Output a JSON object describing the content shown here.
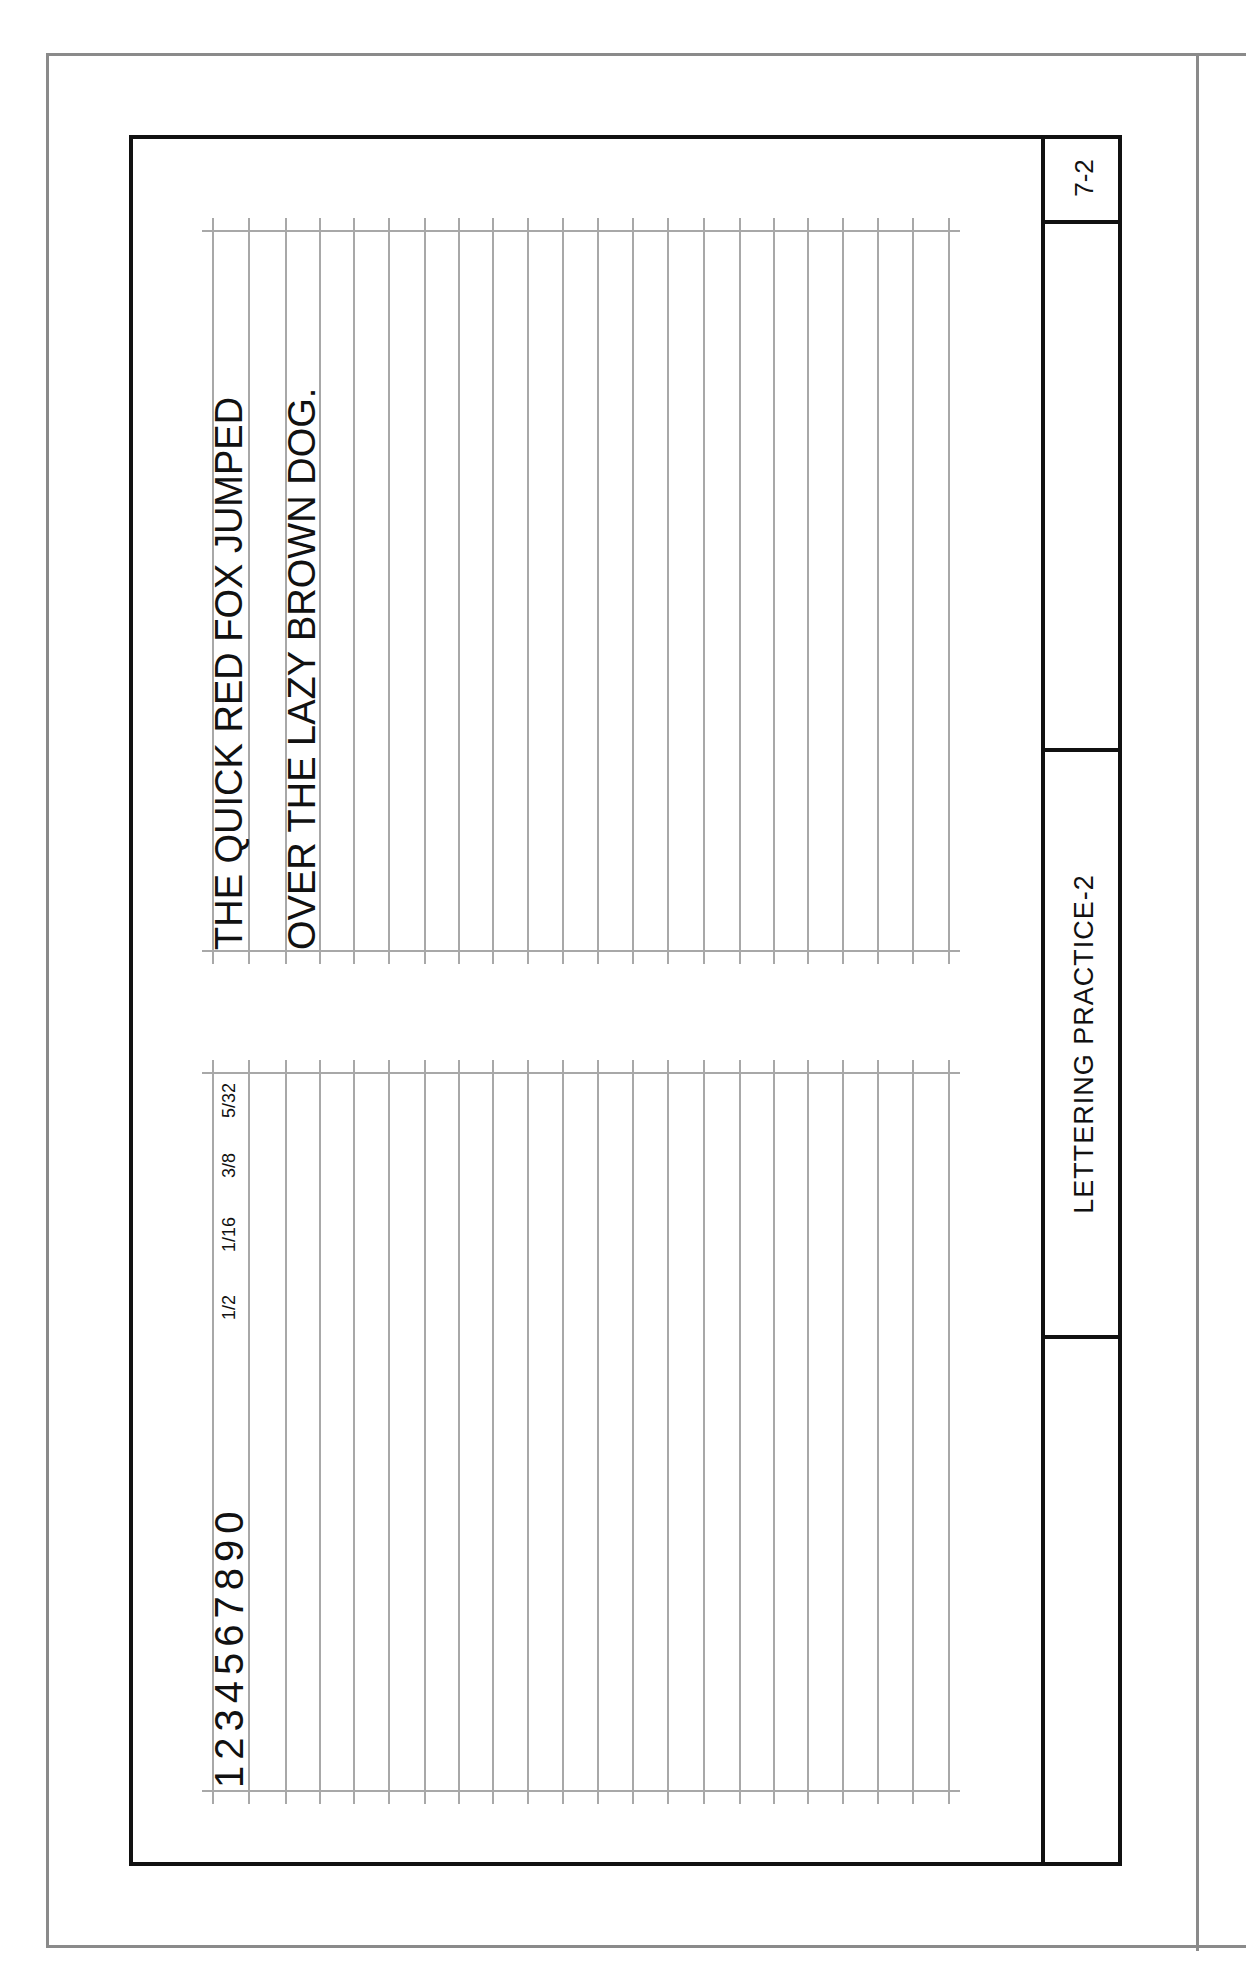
{
  "sheet": {
    "number": "7-2",
    "title": "LETTERING PRACTICE-2",
    "blank_cell": ""
  },
  "upper_grid": {
    "lines": [
      "THE QUICK RED FOX JUMPED",
      "OVER THE LAZY BROWN DOG."
    ]
  },
  "lower_grid": {
    "numerals": "1234567890",
    "fractions": [
      {
        "num": "1",
        "den": "2"
      },
      {
        "num": "1",
        "den": "16"
      },
      {
        "num": "3",
        "den": "8"
      },
      {
        "num": "5",
        "den": "32"
      }
    ]
  },
  "colors": {
    "ink": "#111111",
    "grid": "#a8a8a8",
    "frame": "#8a8a8a"
  }
}
